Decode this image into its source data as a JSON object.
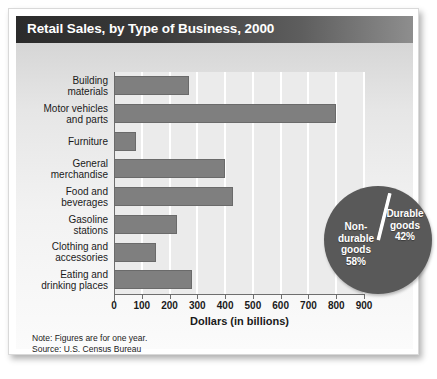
{
  "header": {
    "title": "Retail Sales, by Type of Business, 2000"
  },
  "notes": {
    "note_line": "Note: Figures are for one year.",
    "source_line": "Source:  U.S. Census Bureau"
  },
  "colors": {
    "title_bar_dark": "#2b2b2b",
    "title_bar_light": "#8e8e8e",
    "bar_fill": "#7f7f7f",
    "pie_fill": "#595959",
    "plot_background": "#ebebeb",
    "gridline": "#ffffff",
    "text": "#1a1a1a"
  },
  "chart_data": [
    {
      "type": "bar",
      "orientation": "horizontal",
      "title": "Retail Sales, by Type of Business, 2000",
      "xlabel": "Dollars (in billions)",
      "ylabel": "",
      "xlim": [
        0,
        900
      ],
      "xticks": [
        0,
        100,
        200,
        300,
        400,
        500,
        600,
        700,
        800,
        900
      ],
      "xticklabels": [
        "0",
        "100",
        "200",
        "300",
        "400",
        "500",
        "600",
        "700",
        "800",
        "900"
      ],
      "grid": true,
      "legend": false,
      "categories": [
        "Building materials",
        "Motor vehicles and parts",
        "Furniture",
        "General merchandise",
        "Food and beverages",
        "Gasoline stations",
        "Clothing and accessories",
        "Eating and drinking places"
      ],
      "category_lines": [
        [
          "Building",
          "materials"
        ],
        [
          "Motor vehicles",
          "and parts"
        ],
        [
          "Furniture"
        ],
        [
          "General",
          "merchandise"
        ],
        [
          "Food and",
          "beverages"
        ],
        [
          "Gasoline",
          "stations"
        ],
        [
          "Clothing and",
          "accessories"
        ],
        [
          "Eating and",
          "drinking places"
        ]
      ],
      "values": [
        270,
        800,
        80,
        400,
        430,
        225,
        150,
        280
      ]
    },
    {
      "type": "pie",
      "title": "",
      "labels": [
        "Non-durable goods",
        "Durable goods"
      ],
      "label_lines": [
        [
          "Non-",
          "durable",
          "goods",
          "58%"
        ],
        [
          "Durable",
          "goods",
          "42%"
        ]
      ],
      "values": [
        58,
        42
      ],
      "value_labels": [
        "58%",
        "42%"
      ],
      "legend": false
    }
  ]
}
